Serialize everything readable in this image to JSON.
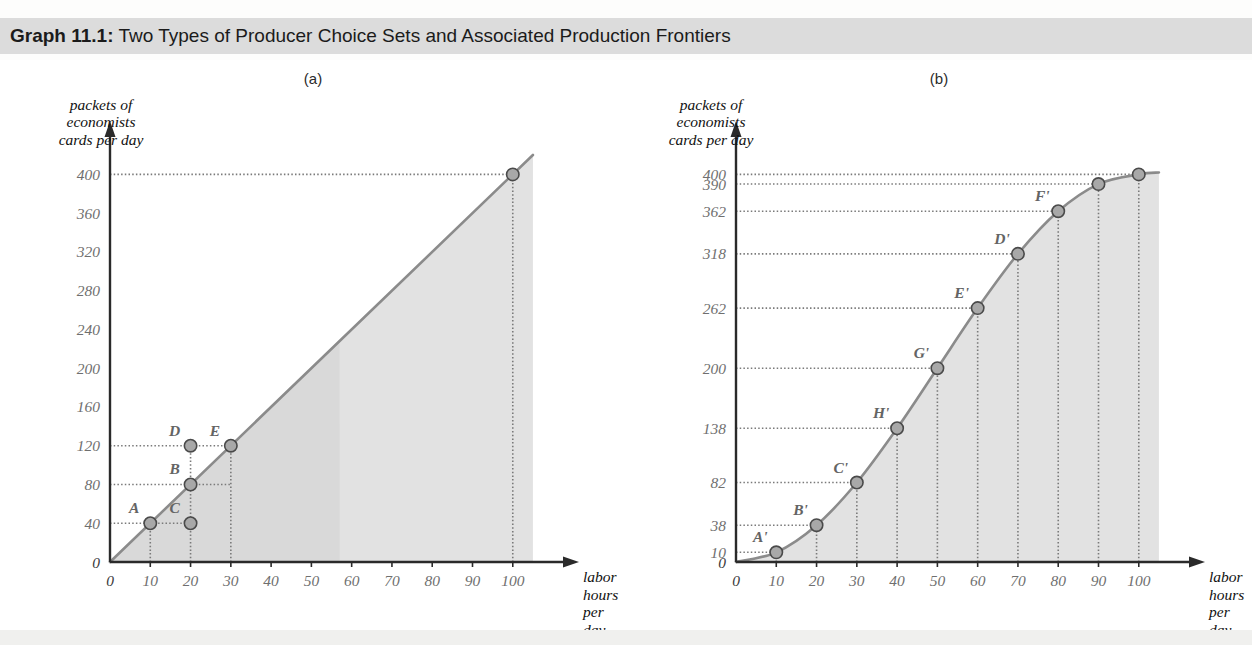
{
  "header": {
    "label": "Graph 11.1:",
    "title": "Two Types of Producer Choice Sets and Associated Production Frontiers"
  },
  "colors": {
    "header_bg": "#dcdcdc",
    "axis": "#2a2a2a",
    "curve": "#8b8b8b",
    "fill_light": "#e2e2e2",
    "fill_dark": "#d2d2d2",
    "tick_text": "#6f6f6f",
    "point_fill": "#a8a8a8",
    "point_stroke": "#4a4a4a",
    "guide": "#7a7a7a"
  },
  "panels": [
    {
      "key": "a",
      "caption": "(a)",
      "ylabel": "packets of\neconomists\ncards per day",
      "xlabel": "labor hours\nper day",
      "xticks": [
        0,
        10,
        20,
        30,
        40,
        50,
        60,
        70,
        80,
        90,
        100
      ],
      "yticks": [
        0,
        40,
        80,
        120,
        160,
        200,
        240,
        280,
        320,
        360,
        400
      ],
      "xlim": [
        0,
        108
      ],
      "ylim": [
        0,
        420
      ],
      "frontier_type": "linear",
      "frontier": [
        [
          0,
          0
        ],
        [
          105,
          420
        ]
      ],
      "points": [
        {
          "label": "A",
          "x": 10,
          "y": 40,
          "dx": -16,
          "dy": -10
        },
        {
          "label": "C",
          "x": 20,
          "y": 40,
          "dx": -16,
          "dy": -10
        },
        {
          "label": "B",
          "x": 20,
          "y": 80,
          "dx": -16,
          "dy": -10
        },
        {
          "label": "D",
          "x": 20,
          "y": 120,
          "dx": -16,
          "dy": -10
        },
        {
          "label": "E",
          "x": 30,
          "y": 120,
          "dx": -16,
          "dy": -10
        },
        {
          "label": "",
          "x": 100,
          "y": 400,
          "dx": 0,
          "dy": 0
        }
      ],
      "hguides": [
        {
          "y": 400,
          "x0": 0,
          "x1": 100
        },
        {
          "y": 120,
          "x0": 0,
          "x1": 30
        },
        {
          "y": 80,
          "x0": 0,
          "x1": 30
        },
        {
          "y": 40,
          "x0": 0,
          "x1": 20
        }
      ],
      "vguides": [
        {
          "x": 10,
          "y0": 0,
          "y1": 40
        },
        {
          "x": 20,
          "y0": 0,
          "y1": 120
        },
        {
          "x": 30,
          "y0": 0,
          "y1": 120
        },
        {
          "x": 100,
          "y0": 0,
          "y1": 400
        }
      ]
    },
    {
      "key": "b",
      "caption": "(b)",
      "ylabel": "packets of\neconomists\ncards per day",
      "xlabel": "labor hours\nper day",
      "xticks": [
        0,
        10,
        20,
        30,
        40,
        50,
        60,
        70,
        80,
        90,
        100
      ],
      "yticks": [
        0,
        10,
        38,
        82,
        138,
        200,
        262,
        318,
        362,
        390,
        400
      ],
      "xlim": [
        0,
        108
      ],
      "ylim": [
        0,
        420
      ],
      "frontier_type": "sigmoid",
      "frontier": [
        [
          0,
          0
        ],
        [
          10,
          10
        ],
        [
          20,
          38
        ],
        [
          30,
          82
        ],
        [
          40,
          138
        ],
        [
          50,
          200
        ],
        [
          60,
          262
        ],
        [
          70,
          318
        ],
        [
          80,
          362
        ],
        [
          90,
          390
        ],
        [
          100,
          400
        ],
        [
          105,
          402
        ]
      ],
      "points": [
        {
          "label": "A'",
          "x": 10,
          "y": 10,
          "dx": -16,
          "dy": -10
        },
        {
          "label": "B'",
          "x": 20,
          "y": 38,
          "dx": -16,
          "dy": -10
        },
        {
          "label": "C'",
          "x": 30,
          "y": 82,
          "dx": -16,
          "dy": -10
        },
        {
          "label": "H'",
          "x": 40,
          "y": 138,
          "dx": -16,
          "dy": -10
        },
        {
          "label": "G'",
          "x": 50,
          "y": 200,
          "dx": -16,
          "dy": -10
        },
        {
          "label": "E'",
          "x": 60,
          "y": 262,
          "dx": -16,
          "dy": -10
        },
        {
          "label": "D'",
          "x": 70,
          "y": 318,
          "dx": -16,
          "dy": -10
        },
        {
          "label": "F'",
          "x": 80,
          "y": 362,
          "dx": -16,
          "dy": -10
        },
        {
          "label": "",
          "x": 90,
          "y": 390,
          "dx": 0,
          "dy": 0
        },
        {
          "label": "",
          "x": 100,
          "y": 400,
          "dx": 0,
          "dy": 0
        }
      ],
      "hguides": [
        {
          "y": 400,
          "x0": 0,
          "x1": 100
        },
        {
          "y": 390,
          "x0": 0,
          "x1": 90
        },
        {
          "y": 362,
          "x0": 0,
          "x1": 80
        },
        {
          "y": 318,
          "x0": 0,
          "x1": 70
        },
        {
          "y": 262,
          "x0": 0,
          "x1": 60
        },
        {
          "y": 200,
          "x0": 0,
          "x1": 50
        },
        {
          "y": 138,
          "x0": 0,
          "x1": 40
        },
        {
          "y": 82,
          "x0": 0,
          "x1": 30
        },
        {
          "y": 38,
          "x0": 0,
          "x1": 20
        },
        {
          "y": 10,
          "x0": 0,
          "x1": 10
        }
      ],
      "vguides": [
        {
          "x": 10,
          "y0": 0,
          "y1": 10
        },
        {
          "x": 20,
          "y0": 0,
          "y1": 38
        },
        {
          "x": 30,
          "y0": 0,
          "y1": 82
        },
        {
          "x": 40,
          "y0": 0,
          "y1": 138
        },
        {
          "x": 50,
          "y0": 0,
          "y1": 200
        },
        {
          "x": 60,
          "y0": 0,
          "y1": 262
        },
        {
          "x": 70,
          "y0": 0,
          "y1": 318
        },
        {
          "x": 80,
          "y0": 0,
          "y1": 362
        },
        {
          "x": 90,
          "y0": 0,
          "y1": 390
        },
        {
          "x": 100,
          "y0": 0,
          "y1": 400
        }
      ]
    }
  ],
  "chart_data": {
    "type": "line",
    "title": "Two Types of Producer Choice Sets and Associated Production Frontiers",
    "xlabel": "labor hours per day",
    "ylabel": "packets of economists cards per day",
    "charts": [
      {
        "panel": "(a)",
        "description": "Linear production frontier (constant returns) with shaded producer choice set below the ray",
        "xlim": [
          0,
          100
        ],
        "ylim": [
          0,
          400
        ],
        "xticks": [
          0,
          10,
          20,
          30,
          40,
          50,
          60,
          70,
          80,
          90,
          100
        ],
        "yticks": [
          0,
          40,
          80,
          120,
          160,
          200,
          240,
          280,
          320,
          360,
          400
        ],
        "x": [
          0,
          10,
          20,
          30,
          100
        ],
        "y": [
          0,
          40,
          80,
          120,
          400
        ],
        "labeled_points": [
          {
            "label": "A",
            "x": 10,
            "y": 40
          },
          {
            "label": "C",
            "x": 20,
            "y": 40
          },
          {
            "label": "B",
            "x": 20,
            "y": 80
          },
          {
            "label": "D",
            "x": 20,
            "y": 120
          },
          {
            "label": "E",
            "x": 30,
            "y": 120
          }
        ]
      },
      {
        "panel": "(b)",
        "description": "S-shaped production frontier (increasing then diminishing returns) with shaded producer choice set below the curve",
        "xlim": [
          0,
          100
        ],
        "ylim": [
          0,
          400
        ],
        "xticks": [
          0,
          10,
          20,
          30,
          40,
          50,
          60,
          70,
          80,
          90,
          100
        ],
        "yticks": [
          0,
          10,
          38,
          82,
          138,
          200,
          262,
          318,
          362,
          390,
          400
        ],
        "x": [
          0,
          10,
          20,
          30,
          40,
          50,
          60,
          70,
          80,
          90,
          100
        ],
        "y": [
          0,
          10,
          38,
          82,
          138,
          200,
          262,
          318,
          362,
          390,
          400
        ],
        "labeled_points": [
          {
            "label": "A'",
            "x": 10,
            "y": 10
          },
          {
            "label": "B'",
            "x": 20,
            "y": 38
          },
          {
            "label": "C'",
            "x": 30,
            "y": 82
          },
          {
            "label": "H'",
            "x": 40,
            "y": 138
          },
          {
            "label": "G'",
            "x": 50,
            "y": 200
          },
          {
            "label": "E'",
            "x": 60,
            "y": 262
          },
          {
            "label": "D'",
            "x": 70,
            "y": 318
          },
          {
            "label": "F'",
            "x": 80,
            "y": 362
          }
        ]
      }
    ],
    "grid": "dotted guide lines to each labeled point",
    "legend": "none"
  }
}
